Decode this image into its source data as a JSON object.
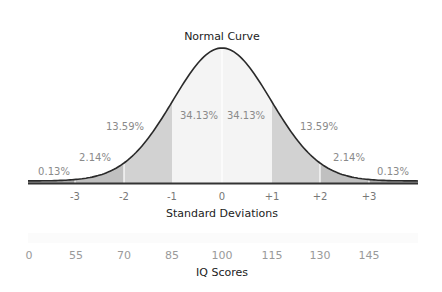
{
  "chart_data": {
    "type": "area",
    "title": "Normal Curve",
    "xlabel": "Standard Deviations",
    "secondary_xlabel": "IQ Scores",
    "sd_ticks": [
      "-3",
      "-2",
      "-1",
      "0",
      "+1",
      "+2",
      "+3"
    ],
    "iq_ticks": [
      "0",
      "55",
      "70",
      "85",
      "100",
      "115",
      "130",
      "145"
    ],
    "regions": [
      {
        "range": "< -3",
        "percent": "0.13%"
      },
      {
        "range": "-3 to -2",
        "percent": "2.14%"
      },
      {
        "range": "-2 to -1",
        "percent": "13.59%"
      },
      {
        "range": "-1 to 0",
        "percent": "34.13%"
      },
      {
        "range": "0 to +1",
        "percent": "34.13%"
      },
      {
        "range": "+1 to +2",
        "percent": "13.59%"
      },
      {
        "range": "+2 to +3",
        "percent": "2.14%"
      },
      {
        "range": "> +3",
        "percent": "0.13%"
      }
    ],
    "colors": {
      "center": "#f4f4f4",
      "one_two": "#d2d2d2",
      "two_three": "#c0c0c0",
      "tail": "#a9a9a9",
      "curve": "#2a2a2a"
    },
    "grid": false,
    "legend": "none"
  }
}
